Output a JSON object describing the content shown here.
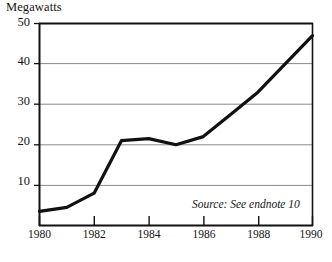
{
  "chart_data": {
    "type": "line",
    "title": "Megawatts",
    "xlabel": "",
    "ylabel": "Megawatts",
    "x": [
      1980,
      1981,
      1982,
      1983,
      1984,
      1985,
      1986,
      1987,
      1988,
      1989,
      1990
    ],
    "values": [
      3.5,
      4.5,
      8.0,
      21.0,
      21.5,
      20.0,
      22.0,
      27.5,
      33.0,
      40.0,
      47.0
    ],
    "series": [
      {
        "name": "Megawatts",
        "values": [
          3.5,
          4.5,
          8.0,
          21.0,
          21.5,
          20.0,
          22.0,
          27.5,
          33.0,
          40.0,
          47.0
        ]
      }
    ],
    "xlim": [
      1980,
      1990
    ],
    "ylim": [
      0,
      50
    ],
    "ytick_labels": [
      "10",
      "20",
      "30",
      "40",
      "50"
    ],
    "ytick_values": [
      10,
      20,
      30,
      40,
      50
    ],
    "xtick_labels": [
      "1980",
      "1982",
      "1984",
      "1986",
      "1988",
      "1990"
    ],
    "xtick_values": [
      1980,
      1982,
      1984,
      1986,
      1988,
      1990
    ],
    "grid": "horizontal",
    "legend": "none",
    "annotations": [
      {
        "text": "Source: See endnote 10",
        "position": "inside-lower-right",
        "style": "italic"
      }
    ],
    "line_color": "#111111",
    "grid_color": "#8a8a8a",
    "axis_color": "#111111",
    "background": "#ffffff"
  },
  "labels": {
    "y_axis_title": "Megawatts",
    "y_50": "50",
    "y_40": "40",
    "y_30": "30",
    "y_20": "20",
    "y_10": "10",
    "x_1980": "1980",
    "x_1982": "1982",
    "x_1984": "1984",
    "x_1986": "1986",
    "x_1988": "1988",
    "x_1990": "1990",
    "source_note": "Source: See endnote 10"
  }
}
